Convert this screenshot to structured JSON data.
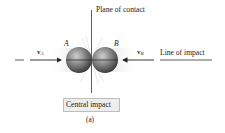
{
  "figure": {
    "plane_label": "Plane of contact",
    "line_label": "Line of impact",
    "point_a": "A",
    "point_b": "B",
    "velocity_a": {
      "symbol": "v",
      "subscript": "A"
    },
    "velocity_b": {
      "symbol": "v",
      "subscript": "B"
    },
    "title": "Central impact",
    "caption": "(a)"
  },
  "colors": {
    "line": "#333333",
    "sphere_light": "#b5b5b5",
    "sphere_dark": "#3d3d3d",
    "box_fill": "#eeeeee",
    "box_border": "#bdbdbd",
    "motion_blur": "#e3e3e3"
  }
}
